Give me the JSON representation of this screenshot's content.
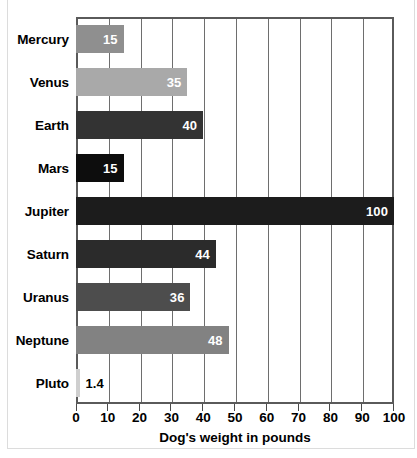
{
  "chart_data": {
    "type": "bar",
    "orientation": "horizontal",
    "title": "",
    "xlabel": "Dog's weight in pounds",
    "ylabel": "",
    "xlim": [
      0,
      100
    ],
    "xticks": [
      "0",
      "10",
      "20",
      "30",
      "40",
      "50",
      "60",
      "70",
      "80",
      "90",
      "100"
    ],
    "grid": true,
    "legend": "none",
    "categories": [
      "Mercury",
      "Venus",
      "Earth",
      "Mars",
      "Jupiter",
      "Saturn",
      "Uranus",
      "Neptune",
      "Pluto"
    ],
    "values": [
      15,
      35,
      40,
      15,
      100,
      44,
      36,
      48,
      1.4
    ],
    "value_labels": [
      "15",
      "35",
      "40",
      "15",
      "100",
      "44",
      "36",
      "48",
      "1.4"
    ],
    "bars": [
      {
        "category": "Mercury",
        "value": 15,
        "label": "15",
        "color": "#8f8f8f",
        "label_placement": "inside"
      },
      {
        "category": "Venus",
        "value": 35,
        "label": "35",
        "color": "#a9a9a9",
        "label_placement": "inside"
      },
      {
        "category": "Earth",
        "value": 40,
        "label": "40",
        "color": "#333333",
        "label_placement": "inside"
      },
      {
        "category": "Mars",
        "value": 15,
        "label": "15",
        "color": "#0d0d0d",
        "label_placement": "inside"
      },
      {
        "category": "Jupiter",
        "value": 100,
        "label": "100",
        "color": "#1c1c1c",
        "label_placement": "inside"
      },
      {
        "category": "Saturn",
        "value": 44,
        "label": "44",
        "color": "#2b2b2b",
        "label_placement": "inside"
      },
      {
        "category": "Uranus",
        "value": 36,
        "label": "36",
        "color": "#4d4d4d",
        "label_placement": "inside"
      },
      {
        "category": "Neptune",
        "value": 48,
        "label": "48",
        "color": "#828282",
        "label_placement": "inside"
      },
      {
        "category": "Pluto",
        "value": 1.4,
        "label": "1.4",
        "color": "#cfcfcf",
        "label_placement": "outside"
      }
    ]
  },
  "colors": {
    "axis": "#5a5a5a",
    "gridline": "#6e6e6e",
    "text": "#000000",
    "value_text_inside": "#ffffff",
    "value_text_outside": "#000000",
    "background": "#ffffff",
    "page_frame": "#dcdcdc"
  }
}
